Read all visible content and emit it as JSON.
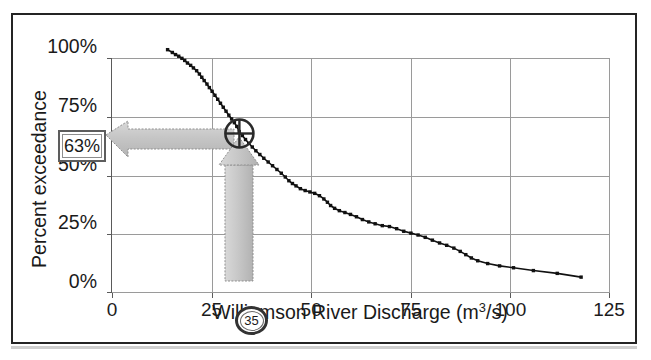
{
  "figure": {
    "frame_color": "#242424",
    "background": "#ffffff"
  },
  "chart_data": {
    "type": "line",
    "title": "",
    "subtitle": "",
    "xlabel": "Williamson River Discharge (m3/s)",
    "xlabel_base": "Williamson River Discharge (m",
    "xlabel_sup": "3",
    "xlabel_tail": "/s)",
    "ylabel": "Percent exceedance",
    "xlim": [
      0,
      125
    ],
    "ylim": [
      0,
      100
    ],
    "grid": true,
    "legend": "none",
    "xticks": [
      0,
      25,
      50,
      75,
      100,
      125
    ],
    "xtick_labels": [
      "0",
      "25",
      "50",
      "75",
      "100",
      "125"
    ],
    "yticks": [
      0,
      25,
      50,
      75,
      100
    ],
    "ytick_labels": [
      "0%",
      "25%",
      "50%",
      "75%",
      "100%"
    ],
    "series": [
      {
        "name": "Flow duration curve",
        "marker": "square",
        "color": "#111111",
        "x": [
          17.0,
          18.2,
          19.0,
          19.8,
          20.6,
          21.3,
          22.0,
          22.8,
          23.5,
          24.3,
          25.0,
          25.6,
          26.2,
          26.9,
          27.5,
          28.2,
          28.9,
          29.6,
          30.3,
          31.0,
          31.7,
          32.4,
          33.1,
          33.8,
          34.4,
          35.0,
          35.8,
          36.6,
          37.4,
          38.3,
          39.2,
          40.2,
          41.2,
          42.3,
          43.4,
          44.5,
          45.6,
          46.6,
          47.5,
          48.4,
          49.3,
          50.4,
          51.6,
          52.8,
          54.0,
          55.2,
          56.3,
          57.2,
          58.0,
          59.0,
          60.2,
          61.6,
          63.0,
          64.5,
          66.0,
          67.6,
          69.2,
          71.0,
          72.8,
          74.6,
          76.4,
          78.2,
          80.0,
          81.8,
          83.6,
          85.4,
          87.2,
          89.0,
          90.6,
          92.0,
          93.4,
          95.0,
          97.5,
          100.5,
          104.0,
          109.0,
          115.0,
          121.0
        ],
        "y": [
          98.0,
          96.8,
          95.9,
          95.2,
          94.3,
          93.4,
          92.3,
          91.3,
          90.2,
          89.0,
          87.6,
          86.2,
          84.8,
          83.3,
          81.8,
          80.2,
          78.5,
          76.8,
          75.1,
          73.4,
          71.7,
          70.0,
          68.4,
          66.8,
          65.2,
          63.0,
          61.3,
          59.6,
          58.0,
          56.4,
          54.8,
          53.2,
          51.6,
          50.0,
          48.4,
          46.8,
          45.2,
          43.6,
          42.0,
          40.8,
          39.8,
          38.6,
          37.8,
          37.2,
          36.6,
          35.6,
          34.2,
          32.8,
          31.4,
          30.2,
          29.2,
          28.4,
          27.6,
          26.6,
          25.4,
          24.4,
          23.6,
          22.8,
          22.4,
          21.5,
          20.4,
          19.6,
          18.8,
          17.8,
          16.6,
          15.4,
          14.4,
          13.2,
          11.8,
          10.4,
          9.0,
          7.8,
          6.6,
          5.6,
          4.8,
          3.6,
          2.4,
          0.8
        ]
      }
    ],
    "annotations": {
      "crosshair": {
        "name": "crosshair-marker",
        "x": 35,
        "y": 63,
        "radius_px": 15
      },
      "horizontal_arrow": {
        "name": "arrow-to-percent-axis",
        "direction": "left",
        "from_x": 35,
        "to_x": 2,
        "at_y": 63,
        "color": "#c3c3c3"
      },
      "vertical_arrow": {
        "name": "arrow-from-discharge-axis",
        "direction": "up",
        "at_x": 35,
        "from_y": 0,
        "to_y": 50,
        "color": "#c3c3c3"
      },
      "percent_readout": {
        "name": "percent-exceedance-readout",
        "value": "63%"
      },
      "discharge_badge": {
        "name": "discharge-value-badge",
        "value": "35"
      }
    }
  }
}
